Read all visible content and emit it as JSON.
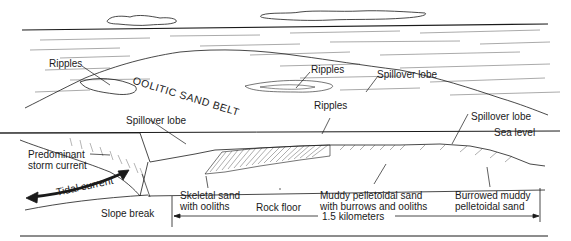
{
  "figure": {
    "ink_color": "#1a1a1a",
    "background": "#ffffff"
  },
  "labels": {
    "ripples_left": "Ripples",
    "oolitic_sand_belt": "OOLITIC SAND BELT",
    "ripples_center_top": "Ripples",
    "spillover_lobe_top": "Spillover lobe",
    "ripples_center": "Ripples",
    "spillover_lobe_left": "Spillover lobe",
    "spillover_lobe_right": "Spillover lobe",
    "sea_level": "Sea level",
    "predominant_storm_current_1": "Predominant",
    "predominant_storm_current_2": "storm current",
    "tidal_current": "Tidal current",
    "slope_break": "Slope break",
    "skeletal_sand_1": "Skeletal sand",
    "skeletal_sand_2": "with ooliths",
    "rock_floor": "Rock floor",
    "muddy_pelletoidal_1": "Muddy pelletoidal sand",
    "muddy_pelletoidal_2": "with burrows and ooliths",
    "burrowed_muddy_1": "Burrowed muddy",
    "burrowed_muddy_2": "pelletoidal sand",
    "scale": "1.5 kilometers"
  }
}
